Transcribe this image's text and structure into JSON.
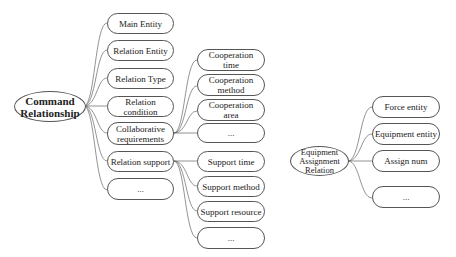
{
  "diagram": {
    "command": {
      "root": "Command\nRelationship",
      "children": [
        "Main Entity",
        "Relation Entity",
        "Relation Type",
        "Relation condition",
        "Collaborative\nrequirements",
        "Relation support",
        "..."
      ],
      "collaborative_children": [
        "Cooperation\ntime",
        "Cooperation\nmethod",
        "Cooperation\narea",
        "..."
      ],
      "support_children": [
        "Support time",
        "Support method",
        "Support resource",
        "..."
      ]
    },
    "equipment": {
      "root": "Equipment\nAssignment\nRelation",
      "children": [
        "Force entity",
        "Equipment entity",
        "Assign num",
        "..."
      ]
    }
  }
}
